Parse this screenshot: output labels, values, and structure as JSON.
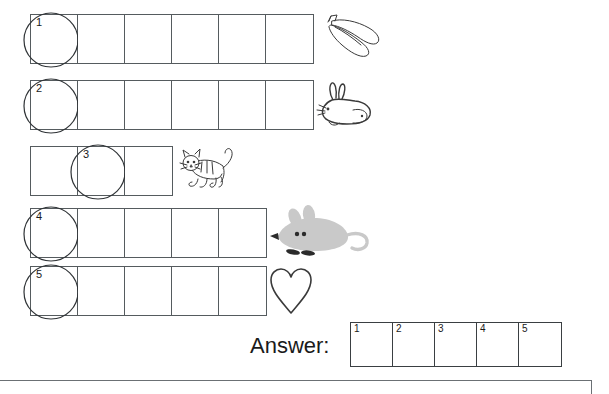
{
  "worksheet": {
    "rows": [
      {
        "index": "1",
        "cell_count": 6,
        "marked_cell": 1,
        "marked_number": "1",
        "picture": "banana-icon",
        "picture_label": "bananas",
        "grid_left": 30,
        "grid_top": 14,
        "picture_left": 315
      },
      {
        "index": "2",
        "cell_count": 6,
        "marked_cell": 1,
        "marked_number": "2",
        "picture": "rabbit-icon",
        "picture_label": "rabbit",
        "grid_left": 30,
        "grid_top": 80,
        "picture_left": 315
      },
      {
        "index": "3",
        "cell_count": 3,
        "marked_cell": 2,
        "marked_number": "3",
        "picture": "cat-icon",
        "picture_label": "cat",
        "grid_left": 30,
        "grid_top": 146,
        "picture_left": 178
      },
      {
        "index": "4",
        "cell_count": 5,
        "marked_cell": 1,
        "marked_number": "4",
        "picture": "mouse-icon",
        "picture_label": "mouse",
        "grid_left": 30,
        "grid_top": 208,
        "picture_left": 268
      },
      {
        "index": "5",
        "cell_count": 5,
        "marked_cell": 1,
        "marked_number": "5",
        "picture": "heart-icon",
        "picture_label": "heart",
        "grid_left": 30,
        "grid_top": 266,
        "picture_left": 268
      }
    ]
  },
  "answer": {
    "label": "Answer:",
    "cells": [
      {
        "number": "1",
        "value": ""
      },
      {
        "number": "2",
        "value": ""
      },
      {
        "number": "3",
        "value": ""
      },
      {
        "number": "4",
        "value": ""
      },
      {
        "number": "5",
        "value": ""
      }
    ]
  },
  "colors": {
    "grid_line": "#555b5e",
    "answer_line": "#3a3f42",
    "rule_line": "#6b7074",
    "text": "#1a1a1a",
    "background": "#ffffff",
    "mouse_body": "#c9c9c9"
  }
}
